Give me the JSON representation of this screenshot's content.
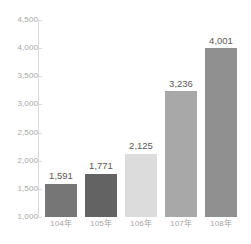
{
  "chart_data": {
    "type": "bar",
    "title": "",
    "subtitle": "",
    "xlabel": "",
    "ylabel": "",
    "categories": [
      "104年",
      "105年",
      "106年",
      "107年",
      "108年"
    ],
    "values": [
      1591,
      1771,
      2125,
      3236,
      4001
    ],
    "value_labels": [
      "1,591",
      "1,771",
      "2,125",
      "3,236",
      "4,001"
    ],
    "ylim": [
      1000,
      4500
    ],
    "ytick_values": [
      1000,
      1500,
      2000,
      2500,
      3000,
      3500,
      4000,
      4500
    ],
    "ytick_labels": [
      "1,000",
      "1,500",
      "2,000",
      "2,500",
      "3,000",
      "3,500",
      "4,000",
      "4,500"
    ],
    "bar_colors": [
      "#767676",
      "#636363",
      "#dcdcdc",
      "#a8a8a8",
      "#909090"
    ],
    "grid": false,
    "legend": null,
    "legend_position": "none",
    "axis_color": "#d9d9d9",
    "tick_label_color": "#a6a6a6",
    "value_label_color": "#595959",
    "background": "#ffffff",
    "annotations": []
  }
}
